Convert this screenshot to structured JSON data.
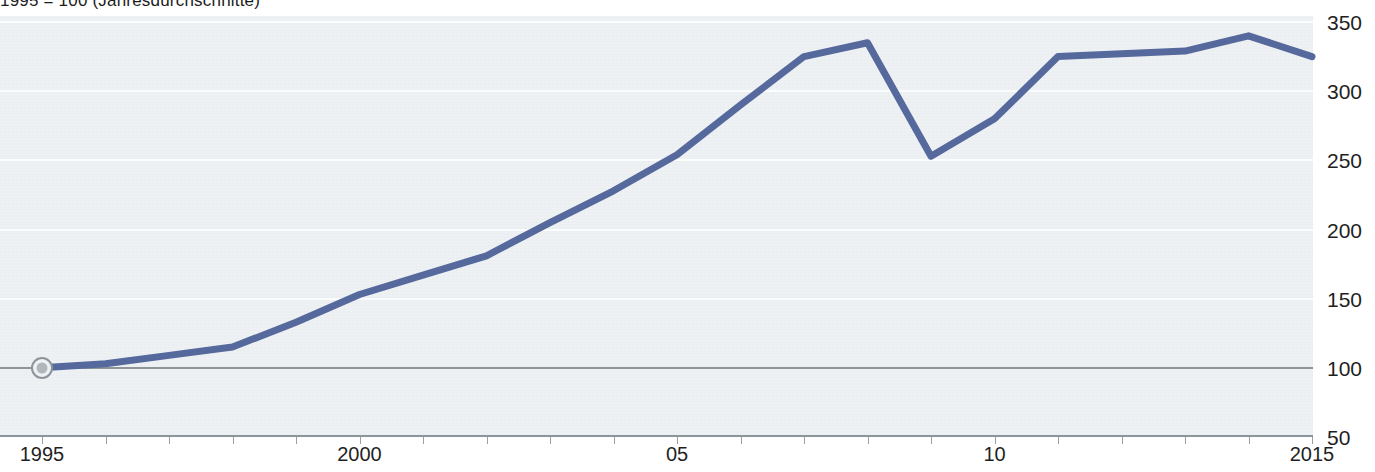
{
  "title": "1995 = 100 (Jahresdurchschnitte)",
  "axis": {
    "y_ticks": [
      350,
      300,
      250,
      200,
      150,
      100,
      50
    ],
    "y_min": 50,
    "y_max": 350,
    "baseline_value": 100,
    "x_tick_labels": [
      {
        "year": 1995,
        "label": "1995"
      },
      {
        "year": 2000,
        "label": "2000"
      },
      {
        "year": 2005,
        "label": "05"
      },
      {
        "year": 2010,
        "label": "10"
      },
      {
        "year": 2015,
        "label": "2015"
      }
    ],
    "x_min": 1995,
    "x_max": 2015
  },
  "colors": {
    "line": "#56699d",
    "plot_background": "#ecf0f3",
    "gridline": "#fafcfd",
    "baseline": "#8e9599",
    "marker_ring": "#8d9499",
    "marker_fill": "#b0b6ba",
    "text": "#1f1f1f"
  },
  "marker": {
    "name": "start-point",
    "year": 1995,
    "value": 100
  },
  "chart_data": {
    "type": "line",
    "title": "1995 = 100 (Jahresdurchschnitte)",
    "xlabel": "",
    "ylabel": "",
    "xlim": [
      1995,
      2015
    ],
    "ylim": [
      50,
      350
    ],
    "grid": true,
    "legend": "none",
    "x": [
      1995,
      1996,
      1997,
      1998,
      1999,
      2000,
      2001,
      2002,
      2003,
      2004,
      2005,
      2006,
      2007,
      2008,
      2009,
      2010,
      2011,
      2012,
      2013,
      2014,
      2015
    ],
    "series": [
      {
        "name": "Index",
        "values": [
          100,
          103,
          109,
          115,
          133,
          153,
          167,
          181,
          205,
          228,
          254,
          290,
          325,
          335,
          253,
          280,
          325,
          327,
          329,
          340,
          325
        ]
      }
    ]
  }
}
